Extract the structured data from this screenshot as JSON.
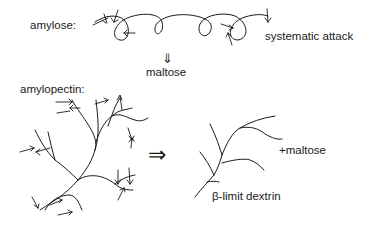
{
  "amylose": {
    "label": "amylose:",
    "attack_label": "systematic attack",
    "product_arrow": "⇓",
    "product": "maltose"
  },
  "amylopectin": {
    "label": "amylopectin:",
    "reaction_arrow": "⇒",
    "product_plus": "+maltose",
    "product_residue": "β-limit dextrin"
  }
}
